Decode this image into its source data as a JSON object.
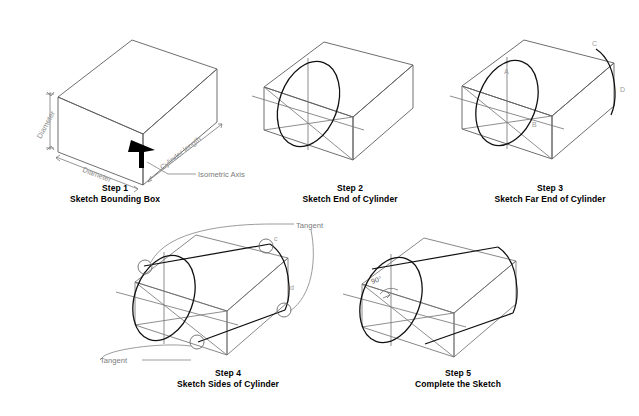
{
  "figure": {
    "background_color": "#ffffff",
    "line_color": "#111111",
    "construction_color": "#7a7a7a"
  },
  "steps": [
    {
      "number": "Step 1",
      "caption": "Sketch Bounding Box",
      "annotations": [
        {
          "name": "diameter-vertical",
          "text": "Diameter"
        },
        {
          "name": "diameter-base",
          "text": "Diameter"
        },
        {
          "name": "cylinder-length",
          "text": "Cylinder length"
        },
        {
          "name": "isometric-axis",
          "text": "Isometric Axis"
        }
      ]
    },
    {
      "number": "Step 2",
      "caption": "Sketch End of Cylinder",
      "annotations": []
    },
    {
      "number": "Step 3",
      "caption": "Sketch Far End of Cylinder",
      "annotations": [
        {
          "name": "point-a",
          "text": "A"
        },
        {
          "name": "point-b",
          "text": "B"
        },
        {
          "name": "point-c",
          "text": "C"
        },
        {
          "name": "point-d",
          "text": "D"
        }
      ]
    },
    {
      "number": "Step 4",
      "caption": "Sketch Sides of Cylinder",
      "annotations": [
        {
          "name": "tangent-upper",
          "text": "Tangent"
        },
        {
          "name": "tangent-lower",
          "text": "Tangent"
        },
        {
          "name": "point-c",
          "text": "c"
        },
        {
          "name": "point-d",
          "text": "d"
        }
      ]
    },
    {
      "number": "Step 5",
      "caption": "Complete the Sketch",
      "annotations": [
        {
          "name": "angle-90",
          "text": "90°"
        }
      ]
    }
  ]
}
